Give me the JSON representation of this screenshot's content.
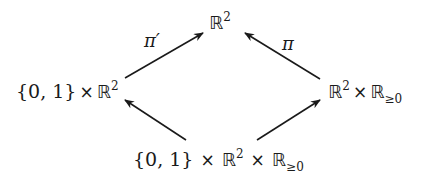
{
  "diagram": {
    "type": "commutative-diagram",
    "nodes": {
      "top": {
        "set": "ℝ",
        "sup": "2"
      },
      "left": {
        "braces": "{0, 1}",
        "times": "×",
        "set": "ℝ",
        "sup": "2"
      },
      "right": {
        "set1": "ℝ",
        "sup1": "2",
        "times": "×",
        "set2": "ℝ",
        "sub2": "≥0"
      },
      "bottom": {
        "braces": "{0, 1}",
        "times1": "×",
        "set1": "ℝ",
        "sup1": "2",
        "times2": "×",
        "set2": "ℝ",
        "sub2": "≥0"
      }
    },
    "edges": [
      {
        "from": "left",
        "to": "top",
        "label": "π′"
      },
      {
        "from": "right",
        "to": "top",
        "label": "π"
      },
      {
        "from": "bottom",
        "to": "left",
        "label": ""
      },
      {
        "from": "bottom",
        "to": "right",
        "label": ""
      }
    ],
    "stroke_color": "#1a1a1a"
  }
}
